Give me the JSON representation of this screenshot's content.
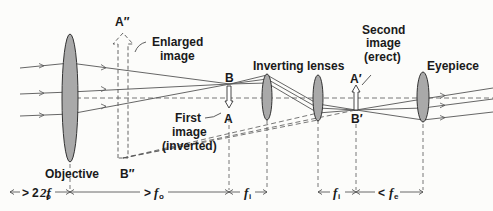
{
  "diagram": {
    "labels": {
      "objective": "Objective",
      "inverting_lenses": "Inverting lenses",
      "eyepiece": "Eyepiece",
      "enlarged_image_line1": "Enlarged",
      "enlarged_image_line2": "image",
      "first_image_line1": "First",
      "first_image_line2": "image",
      "first_image_line3": "(inverted)",
      "second_image_line1": "Second",
      "second_image_line2": "image",
      "second_image_line3": "(erect)",
      "point_B": "B",
      "point_A": "A",
      "point_A_prime": "A′",
      "point_B_prime": "B′",
      "point_A_double": "A″",
      "point_B_double": "B″"
    },
    "dimensions": [
      {
        "label": "2f",
        "sub": "o",
        "prefix": ">"
      },
      {
        "label": "f",
        "sub": "o",
        "prefix": ">"
      },
      {
        "label": "f",
        "sub": "i",
        "prefix": ""
      },
      {
        "label": "f",
        "sub": "i",
        "prefix": ""
      },
      {
        "label": "f",
        "sub": "e",
        "prefix": "<"
      }
    ],
    "colors": {
      "lens_fill": "#a9a9a9",
      "line": "#555555",
      "background": "#fcfcfa"
    }
  }
}
